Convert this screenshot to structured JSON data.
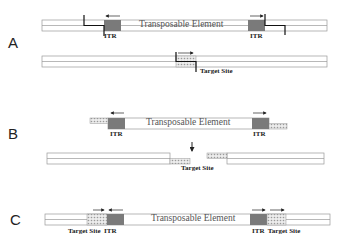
{
  "panels": [
    {
      "label": "A",
      "element_label": "Transposable Element",
      "itr_left": "ITR",
      "itr_right": "ITR",
      "target_label": "Target Site"
    },
    {
      "label": "B",
      "element_label": "Transposable Element",
      "itr_left": "ITR",
      "itr_right": "ITR",
      "target_label": "Target Site"
    },
    {
      "label": "C",
      "element_label": "Transposable Element",
      "left_labels": "Target Site  ITR",
      "right_labels": "ITR  Target Site"
    }
  ],
  "colors": {
    "itr_fill": "#7a7a7a",
    "dna_outline": "#999999",
    "target_fill": "#d8d8d8",
    "cut_line": "#111111"
  }
}
